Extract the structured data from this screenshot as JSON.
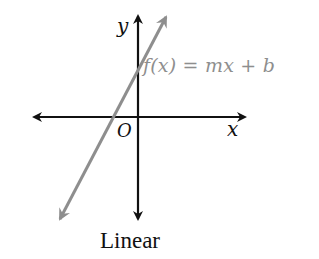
{
  "figure": {
    "caption": "Linear",
    "axes": {
      "x_label": "x",
      "y_label": "y",
      "origin_label": "O",
      "axis_color": "#111111"
    },
    "function": {
      "label": "f(x) = mx + b",
      "line_color": "#8e8e8e",
      "type": "linear",
      "slope": "positive",
      "y_intercept": "positive"
    }
  }
}
